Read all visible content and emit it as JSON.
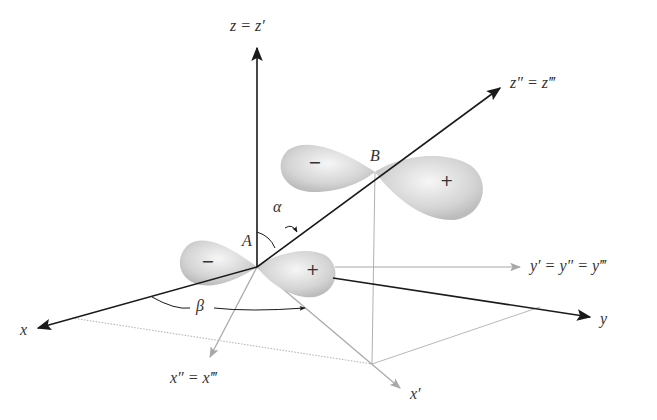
{
  "diagram": {
    "type": "3D coordinate transformation of p-orbitals (Euler angle rotation)",
    "colors": {
      "main_axis": "#1a1a1a",
      "secondary_axis": "#a8a8a8",
      "lobe_fill": "#d9d9d9",
      "label": "#333333"
    },
    "labels": {
      "z_axis": "z = z′",
      "z2_axis": "z″ = z‴",
      "x_axis": "x",
      "y_axis": "y",
      "y_prime_axis": "y′ = y″ = y‴",
      "x2_axis": "x″ = x‴",
      "x_prime_axis": "x′",
      "point_a": "A",
      "point_b": "B",
      "angle_alpha": "α",
      "angle_beta": "β"
    },
    "orbitals": [
      {
        "center": "A",
        "negative_lobe_sign": "−",
        "positive_lobe_sign": "+"
      },
      {
        "center": "B",
        "negative_lobe_sign": "−",
        "positive_lobe_sign": "+"
      }
    ]
  }
}
